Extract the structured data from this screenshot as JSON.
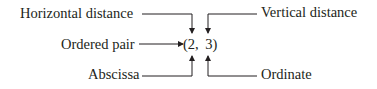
{
  "diagram": {
    "center": "(2, 3)",
    "labels": {
      "horizontal_distance": "Horizontal distance",
      "vertical_distance": "Vertical distance",
      "ordered_pair": "Ordered pair",
      "abscissa": "Abscissa",
      "ordinate": "Ordinate"
    },
    "colors": {
      "text": "#231f20",
      "lines": "#231f20",
      "background": "#ffffff"
    }
  }
}
